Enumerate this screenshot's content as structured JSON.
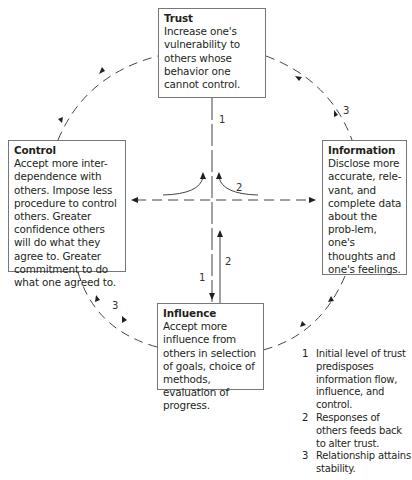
{
  "boxes": {
    "trust": {
      "title": "Trust",
      "body": "Increase one's vulnerability to others whose behavior one cannot control."
    },
    "control": {
      "title": "Control",
      "body": "Accept more inter-dependence with others. Impose less procedure to control others. Greater confidence others will do what they agree to. Greater commitment to do what one agreed to."
    },
    "information": {
      "title": "Information",
      "body": "Disclose more accurate, rele-vant, and complete data about the prob-lem, one's thoughts and one's feelings."
    },
    "influence": {
      "title": "Influence",
      "body": "Accept more influence from others in selection of goals, choice of methods, evaluation of progress."
    }
  },
  "arrow_labels": {
    "trust_down": "1",
    "feedback_curve": "2",
    "influence_down": "1",
    "influence_up": "2",
    "cycle_right": "3",
    "cycle_left": "3"
  },
  "legend": [
    {
      "num": "1",
      "text": "Initial level of trust predisposes information flow, influence, and control."
    },
    {
      "num": "2",
      "text": "Responses of others feeds back to alter trust."
    },
    {
      "num": "3",
      "text": "Relationship attains stability."
    }
  ]
}
